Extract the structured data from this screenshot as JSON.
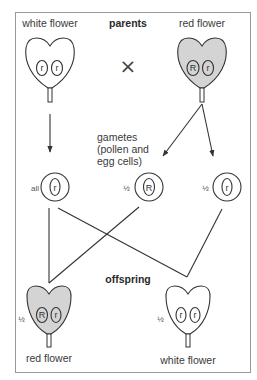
{
  "title": "parents",
  "cross_symbol": "×",
  "parents": {
    "left": {
      "label": "white flower",
      "alleles": [
        "r",
        "r"
      ],
      "color": "#ffffff"
    },
    "right": {
      "label": "red flower",
      "alleles": [
        "R",
        "r"
      ],
      "color": "#d4d4d4"
    }
  },
  "gametes": {
    "label_lines": [
      "gametes",
      "(pollen and",
      "egg cells)"
    ],
    "items": [
      {
        "fraction": "all",
        "allele": "r"
      },
      {
        "fraction": "½",
        "allele": "R"
      },
      {
        "fraction": "½",
        "allele": "r"
      }
    ]
  },
  "offspring_label": "offspring",
  "offspring": {
    "left": {
      "label": "red flower",
      "fraction": "½",
      "alleles": [
        "R",
        "r"
      ],
      "color": "#d4d4d4"
    },
    "right": {
      "label": "white flower",
      "fraction": "½",
      "alleles": [
        "r",
        "r"
      ],
      "color": "#ffffff"
    }
  },
  "colors": {
    "border": "#888888",
    "line": "#333333",
    "red_fill": "#d4d4d4"
  }
}
